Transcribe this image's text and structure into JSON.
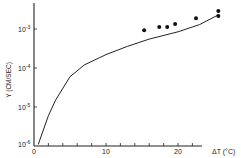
{
  "chart_data": {
    "type": "line",
    "title": "",
    "xlabel": "ΔT (°C)",
    "ylabel": "Y (CM/SEC)",
    "xlim": [
      0,
      23
    ],
    "ylim_log10": [
      -6,
      -3
    ],
    "yscale": "log",
    "x_ticks": [
      0,
      2,
      4,
      6,
      8,
      10,
      12,
      14,
      16,
      18,
      20,
      22
    ],
    "x_tick_labels": [
      {
        "value": 0,
        "label": "0"
      },
      {
        "value": 10,
        "label": "10"
      },
      {
        "value": 20,
        "label": "20"
      }
    ],
    "y_tick_labels": [
      {
        "log10": -3,
        "base": "10",
        "exp": "-3"
      },
      {
        "log10": -4,
        "base": "10",
        "exp": "-4"
      },
      {
        "log10": -5,
        "base": "10",
        "exp": "-5"
      },
      {
        "log10": -6,
        "base": "10",
        "exp": "-6"
      }
    ],
    "grid": false,
    "legend": null,
    "series": [
      {
        "name": "model curve",
        "style": "line",
        "x": [
          0.6,
          1,
          2,
          3,
          5,
          7,
          10,
          13,
          16,
          20,
          23,
          25.6
        ],
        "y": [
          1.1e-06,
          1.8e-06,
          6e-06,
          1.5e-05,
          6e-05,
          0.00012,
          0.00022,
          0.00036,
          0.00055,
          0.00085,
          0.0013,
          0.0023
        ]
      },
      {
        "name": "measured",
        "style": "scatter",
        "x": [
          15.3,
          17.4,
          18.5,
          19.6,
          22.5,
          25.6,
          25.6
        ],
        "y": [
          0.00093,
          0.00112,
          0.00112,
          0.00135,
          0.0019,
          0.0029,
          0.00215
        ]
      }
    ]
  },
  "labels": {
    "x_axis": "ΔT (°C)",
    "y_axis": "Y (CM/SEC)",
    "x0": "0",
    "x10": "10",
    "x20": "20",
    "y_base": "10",
    "y_exp3": "-3",
    "y_exp4": "-4",
    "y_exp5": "-5",
    "y_exp6": "-6"
  }
}
